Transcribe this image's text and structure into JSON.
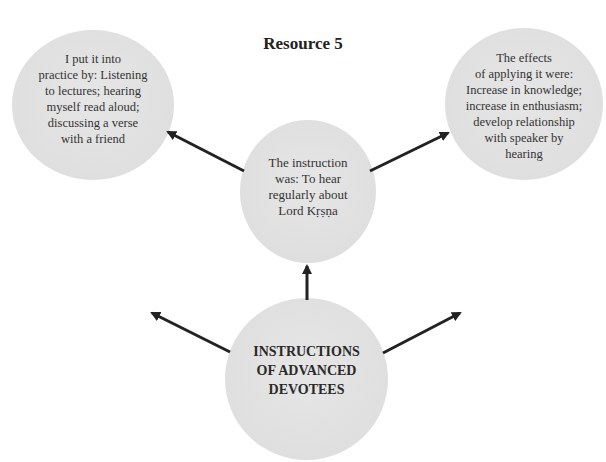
{
  "title": "Resource 5",
  "nodes": {
    "left": {
      "text": "I put it into\npractice by: Listening\nto lectures; hearing\nmyself read aloud;\ndiscussing a verse\nwith a friend"
    },
    "right": {
      "text": "The effects\nof applying it were:\nIncrease in knowledge;\nincrease in enthusiasm;\ndevelop relationship\nwith speaker by\nhearing"
    },
    "center": {
      "text": "The instruction\nwas: To hear\nregularly about\nLord Kṛṣṇa"
    },
    "bottom": {
      "text": "INSTRUCTIONS\nOF ADVANCED\nDEVOTEES"
    }
  },
  "edges": [
    {
      "from": "center",
      "to": "left"
    },
    {
      "from": "center",
      "to": "right"
    },
    {
      "from": "bottom",
      "to": "center"
    },
    {
      "from": "bottom",
      "to": "off-left"
    },
    {
      "from": "bottom",
      "to": "off-right"
    }
  ],
  "colors": {
    "circle_fill": "#e2e2e2",
    "arrow": "#222222",
    "text": "#333333"
  }
}
